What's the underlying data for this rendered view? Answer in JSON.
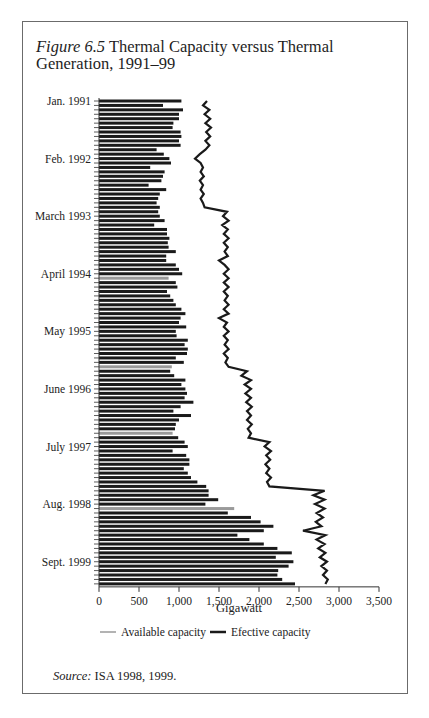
{
  "figure": {
    "label": "Figure 6.5",
    "title": "Thermal Capacity versus Thermal Generation, 1991–99",
    "source_label": "Source:",
    "source_text": "ISA 1998, 1999."
  },
  "colors": {
    "available": "#9a9a9a",
    "effective": "#1a1a1a",
    "axis": "#333333",
    "frame": "#6b6b6b"
  },
  "chart_data": {
    "type": "bar",
    "orientation": "horizontal",
    "title": "Thermal Capacity versus Thermal Generation, 1991–99",
    "xlabel": "Gigawatt",
    "ylabel": "",
    "xlim": [
      0,
      3500
    ],
    "x_ticks": [
      0,
      500,
      1000,
      1500,
      2000,
      2500,
      3000,
      3500
    ],
    "x_tick_labels": [
      "0",
      "500",
      "1,000",
      "1,500",
      "2,000",
      "2,500",
      "3,000",
      "3,500"
    ],
    "y_tick_labels": [
      {
        "label": "Jan. 1991",
        "index": 0
      },
      {
        "label": "Feb. 1992",
        "index": 13
      },
      {
        "label": "March 1993",
        "index": 26
      },
      {
        "label": "April 1994",
        "index": 39
      },
      {
        "label": "May 1995",
        "index": 52
      },
      {
        "label": "June 1996",
        "index": 65
      },
      {
        "label": "July 1997",
        "index": 78
      },
      {
        "label": "Aug. 1998",
        "index": 91
      },
      {
        "label": "Sept. 1999",
        "index": 104
      }
    ],
    "grid": false,
    "legend_position": "bottom",
    "legend": [
      {
        "name": "Available capacity",
        "style": "gray line"
      },
      {
        "name": "Efective capacity",
        "style": "black line"
      }
    ],
    "series": [
      {
        "name": "Bars (monthly thermal generation)",
        "values": [
          1030,
          800,
          1050,
          1000,
          1000,
          930,
          920,
          1020,
          1030,
          1000,
          1020,
          720,
          810,
          880,
          900,
          640,
          820,
          800,
          780,
          620,
          840,
          760,
          740,
          720,
          760,
          740,
          760,
          820,
          690,
          850,
          850,
          880,
          860,
          870,
          960,
          840,
          840,
          960,
          1000,
          1040,
          870,
          960,
          980,
          850,
          890,
          930,
          960,
          1030,
          1080,
          1020,
          1000,
          1090,
          960,
          970,
          1110,
          1070,
          1110,
          1100,
          960,
          1060,
          910,
          890,
          940,
          1080,
          1030,
          1080,
          1100,
          1070,
          1180,
          1020,
          930,
          1150,
          1000,
          960,
          950,
          920,
          990,
          1070,
          1110,
          920,
          1090,
          1130,
          1130,
          1060,
          1110,
          1150,
          1230,
          1340,
          1370,
          1370,
          1490,
          1330,
          1690,
          1610,
          1900,
          2020,
          2180,
          2060,
          1730,
          1880,
          2060,
          2230,
          2410,
          2210,
          2430,
          2370,
          2240,
          2230,
          2290,
          2450
        ]
      },
      {
        "name": "Efective capacity",
        "values": [
          1350,
          1300,
          1380,
          1320,
          1390,
          1330,
          1400,
          1340,
          1390,
          1330,
          1380,
          1330,
          1260,
          1200,
          1270,
          1300,
          1270,
          1310,
          1260,
          1300,
          1270,
          1310,
          1270,
          1300,
          1320,
          1600,
          1550,
          1620,
          1540,
          1610,
          1560,
          1620,
          1560,
          1610,
          1570,
          1610,
          1500,
          1570,
          1620,
          1560,
          1620,
          1560,
          1620,
          1560,
          1610,
          1570,
          1620,
          1560,
          1620,
          1500,
          1600,
          1560,
          1620,
          1560,
          1610,
          1570,
          1620,
          1560,
          1610,
          1580,
          1620,
          1850,
          1780,
          1900,
          1820,
          1900,
          1830,
          1900,
          1840,
          1910,
          1850,
          1900,
          1850,
          1910,
          1860,
          1900,
          1870,
          2130,
          2070,
          2150,
          2090,
          2140,
          2080,
          2130,
          2090,
          2150,
          2100,
          2130,
          2820,
          2680,
          2820,
          2700,
          2820,
          2720,
          2800,
          2710,
          2780,
          2550,
          2830,
          2720,
          2820,
          2740,
          2830,
          2760,
          2850,
          2780,
          2850,
          2800,
          2860,
          2830
        ]
      }
    ]
  }
}
